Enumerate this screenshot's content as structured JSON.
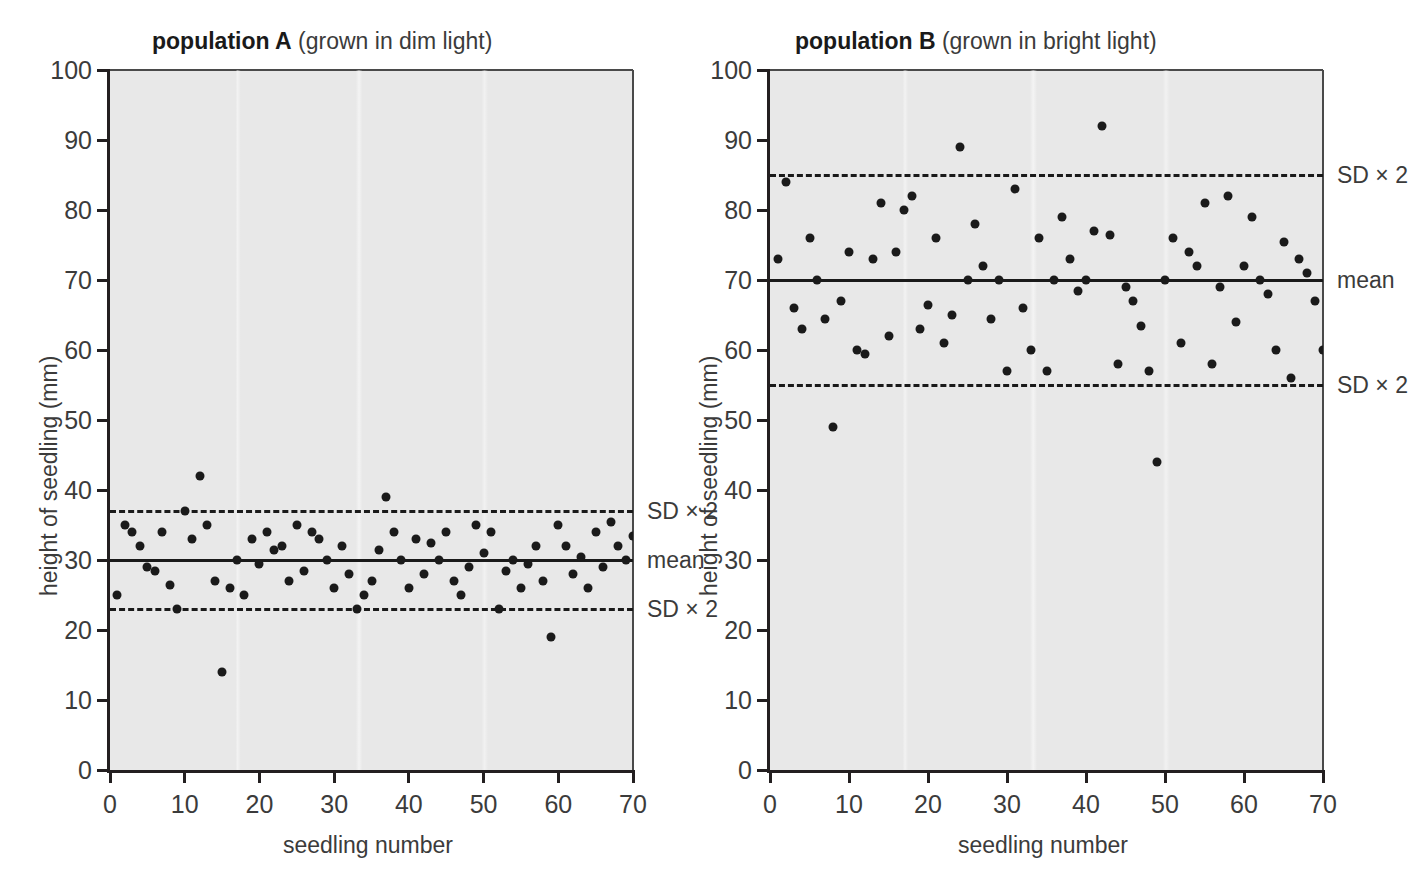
{
  "figure": {
    "background": "#ffffff",
    "plot_background": "#e8e8e8",
    "point_color": "#1a1a1a",
    "line_color": "#1a1a1a"
  },
  "panels": [
    {
      "id": "A",
      "title_bold": "population A",
      "title_rest": " (grown in dim light)",
      "axis_title_x": "seedling number",
      "axis_title_y": "height of seedling (mm)",
      "label_mean": "mean",
      "label_sd_upper": "SD × 2",
      "label_sd_lower": "SD × 2"
    },
    {
      "id": "B",
      "title_bold": "population B",
      "title_rest": " (grown in bright light)",
      "axis_title_x": "seedling number",
      "axis_title_y": "height of seedling (mm)",
      "label_mean": "mean",
      "label_sd_upper": "SD × 2",
      "label_sd_lower": "SD × 2"
    }
  ],
  "chart_data": [
    {
      "type": "scatter",
      "panel": "A",
      "title": "population A (grown in dim light)",
      "xlabel": "seedling number",
      "ylabel": "height of seedling (mm)",
      "xlim": [
        0,
        70
      ],
      "ylim": [
        0,
        100
      ],
      "xticks": [
        0,
        10,
        20,
        30,
        40,
        50,
        60,
        70
      ],
      "yticks": [
        0,
        10,
        20,
        30,
        40,
        50,
        60,
        70,
        80,
        90,
        100
      ],
      "grid": false,
      "legend": false,
      "reference_lines": [
        {
          "label": "SD × 2",
          "value": 37,
          "style": "dashed"
        },
        {
          "label": "mean",
          "value": 30,
          "style": "solid"
        },
        {
          "label": "SD × 2",
          "value": 23,
          "style": "dashed"
        }
      ],
      "mean": 30,
      "sd": 3.5,
      "series": [
        {
          "name": "population A seedlings",
          "x": [
            1,
            2,
            3,
            4,
            5,
            6,
            7,
            8,
            9,
            10,
            11,
            12,
            13,
            14,
            15,
            16,
            17,
            18,
            19,
            20,
            21,
            22,
            23,
            24,
            25,
            26,
            27,
            28,
            29,
            30,
            31,
            32,
            33,
            34,
            35,
            36,
            37,
            38,
            39,
            40,
            41,
            42,
            43,
            44,
            45,
            46,
            47,
            48,
            49,
            50,
            51,
            52,
            53,
            54,
            55,
            56,
            57,
            58,
            59,
            60,
            61,
            62,
            63,
            64,
            65,
            66,
            67,
            68,
            69,
            70
          ],
          "y": [
            25,
            35,
            34,
            32,
            29,
            28.5,
            34,
            26.5,
            23,
            37,
            33,
            42,
            35,
            27,
            14,
            26,
            30,
            25,
            33,
            29.5,
            34,
            31.5,
            32,
            27,
            35,
            28.5,
            34,
            33,
            30,
            26,
            32,
            28,
            23,
            25,
            27,
            31.5,
            39,
            34,
            30,
            26,
            33,
            28,
            32.5,
            30,
            34,
            27,
            25,
            29,
            35,
            31,
            34,
            23,
            28.5,
            30,
            26,
            29.5,
            32,
            27,
            19,
            35,
            32,
            28,
            30.5,
            26,
            34,
            29,
            35.5,
            32,
            30,
            33.5
          ]
        }
      ]
    },
    {
      "type": "scatter",
      "panel": "B",
      "title": "population B (grown in bright light)",
      "xlabel": "seedling number",
      "ylabel": "height of seedling (mm)",
      "xlim": [
        0,
        70
      ],
      "ylim": [
        0,
        100
      ],
      "xticks": [
        0,
        10,
        20,
        30,
        40,
        50,
        60,
        70
      ],
      "yticks": [
        0,
        10,
        20,
        30,
        40,
        50,
        60,
        70,
        80,
        90,
        100
      ],
      "grid": false,
      "legend": false,
      "reference_lines": [
        {
          "label": "SD × 2",
          "value": 85,
          "style": "dashed"
        },
        {
          "label": "mean",
          "value": 70,
          "style": "solid"
        },
        {
          "label": "SD × 2",
          "value": 55,
          "style": "dashed"
        }
      ],
      "mean": 70,
      "sd": 7.5,
      "series": [
        {
          "name": "population B seedlings",
          "x": [
            1,
            2,
            3,
            4,
            5,
            6,
            7,
            8,
            9,
            10,
            11,
            12,
            13,
            14,
            15,
            16,
            17,
            18,
            19,
            20,
            21,
            22,
            23,
            24,
            25,
            26,
            27,
            28,
            29,
            30,
            31,
            32,
            33,
            34,
            35,
            36,
            37,
            38,
            39,
            40,
            41,
            42,
            43,
            44,
            45,
            46,
            47,
            48,
            49,
            50,
            51,
            52,
            53,
            54,
            55,
            56,
            57,
            58,
            59,
            60,
            61,
            62,
            63,
            64,
            65,
            66,
            67,
            68,
            69,
            70
          ],
          "y": [
            73,
            84,
            66,
            63,
            76,
            70,
            64.5,
            49,
            67,
            74,
            60,
            59.5,
            73,
            81,
            62,
            74,
            80,
            82,
            63,
            66.5,
            76,
            61,
            65,
            89,
            70,
            78,
            72,
            64.5,
            70,
            57,
            83,
            66,
            60,
            76,
            57,
            70,
            79,
            73,
            68.5,
            70,
            77,
            92,
            76.5,
            58,
            69,
            67,
            63.5,
            57,
            44,
            70,
            76,
            61,
            74,
            72,
            81,
            58,
            69,
            82,
            64,
            72,
            79,
            70,
            68,
            60,
            75.5,
            56,
            73,
            71,
            67,
            60
          ]
        }
      ]
    }
  ]
}
